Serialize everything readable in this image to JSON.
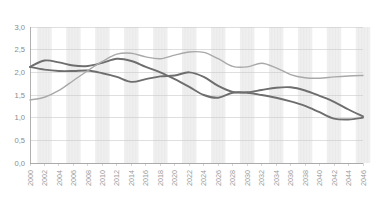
{
  "chart_data": {
    "type": "line",
    "title": "",
    "subtitle": "",
    "xlabel": "",
    "ylabel": "",
    "ylim": [
      0.0,
      3.0
    ],
    "xlim": [
      2000,
      2046
    ],
    "grid": true,
    "legend_position": "none",
    "decimal_separator": ",",
    "y_ticks": [
      "0,0",
      "0,5",
      "1,0",
      "1,5",
      "2,0",
      "2,5",
      "3,0"
    ],
    "y_tick_values": [
      0.0,
      0.5,
      1.0,
      1.5,
      2.0,
      2.5,
      3.0
    ],
    "x": [
      2000,
      2002,
      2004,
      2006,
      2008,
      2010,
      2012,
      2014,
      2016,
      2018,
      2020,
      2022,
      2024,
      2026,
      2028,
      2030,
      2032,
      2034,
      2036,
      2038,
      2040,
      2042,
      2044,
      2046
    ],
    "x_tick_labels": [
      "2000",
      "2002",
      "2004",
      "2006",
      "2008",
      "2010",
      "2012",
      "2014",
      "2016",
      "2018",
      "2020",
      "2022",
      "2024",
      "2026",
      "2028",
      "2030",
      "2032",
      "2034",
      "2036",
      "2038",
      "2040",
      "2042",
      "2044",
      "2046"
    ],
    "series": [
      {
        "name": "series-1",
        "color": "#6e6e6e",
        "width": 1.9,
        "values": [
          2.12,
          2.26,
          2.22,
          2.15,
          2.14,
          2.21,
          2.3,
          2.25,
          2.12,
          2.0,
          1.85,
          1.68,
          1.5,
          1.44,
          1.55,
          1.55,
          1.5,
          1.44,
          1.36,
          1.26,
          1.12,
          0.98,
          0.96,
          1.0
        ]
      },
      {
        "name": "series-2",
        "color": "#6e6e6e",
        "width": 1.9,
        "values": [
          2.12,
          2.06,
          2.03,
          2.03,
          2.04,
          1.98,
          1.9,
          1.79,
          1.85,
          1.91,
          1.93,
          2.0,
          1.9,
          1.7,
          1.57,
          1.56,
          1.61,
          1.66,
          1.67,
          1.6,
          1.48,
          1.35,
          1.18,
          1.03
        ]
      },
      {
        "name": "series-3",
        "color": "#a9a9a9",
        "width": 1.4,
        "values": [
          1.39,
          1.45,
          1.6,
          1.82,
          2.04,
          2.24,
          2.4,
          2.42,
          2.34,
          2.3,
          2.38,
          2.45,
          2.44,
          2.3,
          2.13,
          2.12,
          2.2,
          2.1,
          1.95,
          1.88,
          1.87,
          1.9,
          1.92,
          1.93
        ]
      }
    ]
  },
  "plot_geometry": {
    "left": 30,
    "right": 363,
    "top": 27,
    "bottom": 163,
    "band_color": "#efefef"
  }
}
